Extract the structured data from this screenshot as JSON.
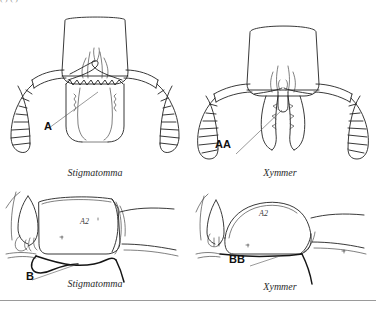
{
  "figure": {
    "top_cut_text": "(  )                                                                                                     (     )",
    "panels": [
      {
        "id": "head-left",
        "view": "frontal head",
        "label": "A",
        "caption": "Stigmatomma",
        "segment_label": ""
      },
      {
        "id": "head-right",
        "view": "frontal head",
        "label": "AA",
        "caption": "Xymmer",
        "segment_label": ""
      },
      {
        "id": "lateral-left",
        "view": "lateral abdominal segment",
        "label": "B",
        "caption": "Stigmatomma",
        "segment_label": "A2"
      },
      {
        "id": "lateral-right",
        "view": "lateral abdominal segment",
        "label": "BB",
        "caption": "Xymmer",
        "segment_label": "A2"
      }
    ],
    "colors": {
      "ink": "#232323",
      "ink_light": "#3a3a3a",
      "leader": "#555555",
      "rule": "#9a9a9a",
      "background": "#ffffff"
    }
  }
}
